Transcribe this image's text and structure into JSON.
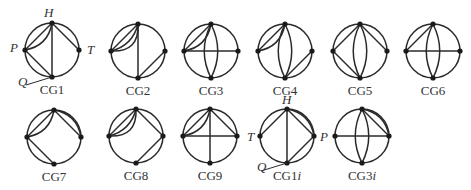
{
  "figure": {
    "colors": {
      "stroke": "#2a2a2a",
      "vertex": "#1a1a1a",
      "text": "#333333",
      "background": "#ffffff"
    },
    "graphs": [
      {
        "id": "CG1",
        "label": "CG1",
        "cx": 52,
        "cy": 50,
        "r": 27,
        "vertex_labels": [
          {
            "text": "H",
            "x": 44,
            "y": 17
          },
          {
            "text": "P",
            "x": 10,
            "y": 52
          },
          {
            "text": "T",
            "x": 87,
            "y": 54
          },
          {
            "text": "Q",
            "x": 18,
            "y": 86
          }
        ],
        "edges": [
          [
            "L",
            "T",
            0
          ],
          [
            "L",
            "T",
            0.35
          ],
          [
            "T",
            "R",
            0
          ],
          [
            "T",
            "B",
            0
          ],
          [
            "L",
            "B",
            0
          ]
        ],
        "q_pointer": true
      },
      {
        "id": "CG2",
        "label": "CG2",
        "cx": 138,
        "cy": 51,
        "r": 27,
        "edges": [
          [
            "L",
            "T",
            0
          ],
          [
            "L",
            "T",
            0.3
          ],
          [
            "L",
            "T",
            0.55
          ],
          [
            "T",
            "B",
            0
          ],
          [
            "B",
            "R",
            0
          ]
        ]
      },
      {
        "id": "CG3",
        "label": "CG3",
        "cx": 211,
        "cy": 51,
        "r": 27,
        "edges": [
          [
            "L",
            "T",
            0
          ],
          [
            "L",
            "T",
            0.35
          ],
          [
            "T",
            "B",
            0.25
          ],
          [
            "T",
            "B",
            -0.25
          ],
          [
            "L",
            "R",
            0
          ]
        ]
      },
      {
        "id": "CG4",
        "label": "CG4",
        "cx": 285,
        "cy": 51,
        "r": 27,
        "edges": [
          [
            "L",
            "T",
            0
          ],
          [
            "L",
            "T",
            0.35
          ],
          [
            "T",
            "B",
            0.25
          ],
          [
            "T",
            "B",
            -0.25
          ],
          [
            "B",
            "R",
            0
          ]
        ]
      },
      {
        "id": "CG5",
        "label": "CG5",
        "cx": 360,
        "cy": 51,
        "r": 27,
        "edges": [
          [
            "L",
            "T",
            0
          ],
          [
            "T",
            "R",
            0
          ],
          [
            "L",
            "B",
            0
          ],
          [
            "T",
            "B",
            0.25
          ],
          [
            "T",
            "B",
            -0.25
          ]
        ]
      },
      {
        "id": "CG6",
        "label": "CG6",
        "cx": 433,
        "cy": 51,
        "r": 27,
        "edges": [
          [
            "L",
            "T",
            0
          ],
          [
            "T",
            "B",
            0.25
          ],
          [
            "T",
            "B",
            -0.25
          ],
          [
            "L",
            "R",
            0
          ]
        ]
      },
      {
        "id": "CG7",
        "label": "CG7",
        "cx": 54,
        "cy": 137,
        "r": 27,
        "edges": [
          [
            "L",
            "T",
            0
          ],
          [
            "L",
            "T",
            0.35
          ],
          [
            "T",
            "R",
            0
          ],
          [
            "T",
            "R",
            -0.35
          ],
          [
            "L",
            "B",
            0
          ]
        ]
      },
      {
        "id": "CG8",
        "label": "CG8",
        "cx": 136,
        "cy": 136,
        "r": 27,
        "edges": [
          [
            "L",
            "T",
            0
          ],
          [
            "L",
            "T",
            0.3
          ],
          [
            "L",
            "T",
            0.55
          ],
          [
            "T",
            "R",
            0
          ],
          [
            "B",
            "R",
            0
          ]
        ]
      },
      {
        "id": "CG9",
        "label": "CG9",
        "cx": 210,
        "cy": 136,
        "r": 27,
        "edges": [
          [
            "L",
            "T",
            0
          ],
          [
            "L",
            "T",
            0.35
          ],
          [
            "T",
            "R",
            0
          ],
          [
            "T",
            "B",
            0
          ],
          [
            "L",
            "R",
            0
          ]
        ]
      },
      {
        "id": "CG1i",
        "label": "CG1",
        "label_suffix": "i",
        "cx": 287,
        "cy": 136,
        "r": 27,
        "vertex_labels": [
          {
            "text": "H",
            "x": 282,
            "y": 104
          },
          {
            "text": "T",
            "x": 247,
            "y": 141
          },
          {
            "text": "P",
            "x": 320,
            "y": 141
          },
          {
            "text": "Q",
            "x": 257,
            "y": 171
          }
        ],
        "edges": [
          [
            "L",
            "T",
            0
          ],
          [
            "T",
            "R",
            0
          ],
          [
            "T",
            "R",
            -0.35
          ],
          [
            "T",
            "B",
            0
          ],
          [
            "B",
            "R",
            0
          ]
        ],
        "q_pointer": true
      },
      {
        "id": "CG3i",
        "label": "CG3",
        "label_suffix": "i",
        "cx": 362,
        "cy": 136,
        "r": 27,
        "edges": [
          [
            "T",
            "R",
            0
          ],
          [
            "T",
            "R",
            -0.35
          ],
          [
            "T",
            "B",
            0.25
          ],
          [
            "T",
            "B",
            -0.25
          ],
          [
            "L",
            "R",
            0
          ]
        ]
      }
    ]
  }
}
